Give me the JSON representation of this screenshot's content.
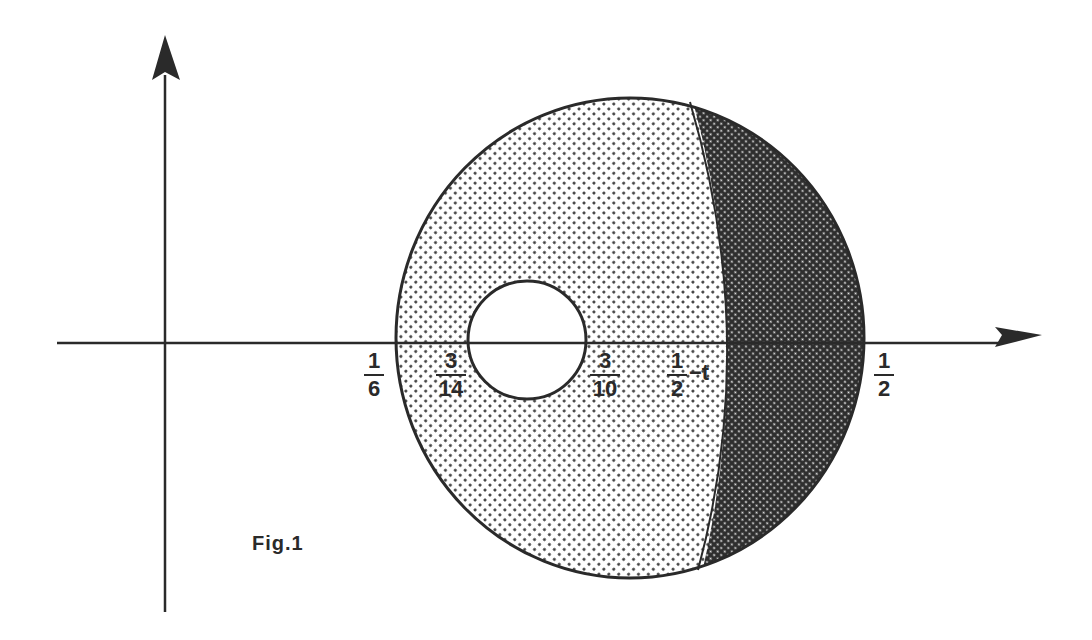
{
  "figure": {
    "caption": "Fig.1",
    "colors": {
      "line": "#2a2a2a",
      "light_stipple": "#d4d4d4",
      "dark_crosshatch": "#5a5a5a",
      "background": "#ffffff"
    },
    "axes": {
      "x_axis": "horizontal-arrow",
      "y_axis": "vertical-arrow"
    },
    "regions": [
      {
        "name": "large-disk",
        "fill": "light dotted stipple"
      },
      {
        "name": "inner-hole",
        "fill": "white (unshaded)"
      },
      {
        "name": "right-crescent",
        "fill": "dark cross-hatched stipple"
      }
    ],
    "labels": [
      {
        "id": "one-sixth",
        "num": "1",
        "den": "6",
        "suffix": ""
      },
      {
        "id": "three-fourteenths",
        "num": "3",
        "den": "14",
        "suffix": ""
      },
      {
        "id": "three-tenths",
        "num": "3",
        "den": "10",
        "suffix": ""
      },
      {
        "id": "half-minus-t",
        "num": "1",
        "den": "2",
        "suffix": "−t"
      },
      {
        "id": "one-half",
        "num": "1",
        "den": "2",
        "suffix": ""
      }
    ]
  }
}
